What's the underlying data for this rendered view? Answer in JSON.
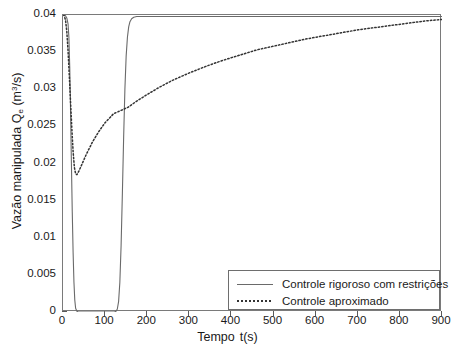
{
  "chart_data": {
    "type": "line",
    "title": "",
    "xlabel_prefix": "Tempo",
    "xlabel_suffix": "t(s)",
    "ylabel_text": "Vazão manipulada Q",
    "ylabel_sub": "e",
    "ylabel_unit_pre": " (m",
    "ylabel_unit_sup": "3",
    "ylabel_unit_post": "/s)",
    "xlim": [
      0,
      900
    ],
    "ylim": [
      0,
      0.04
    ],
    "xticks": [
      0,
      100,
      200,
      300,
      400,
      500,
      600,
      700,
      800,
      900
    ],
    "xtick_labels": [
      "0",
      "100",
      "200",
      "300",
      "400",
      "500",
      "600",
      "700",
      "800",
      "900"
    ],
    "yticks": [
      0,
      0.005,
      0.01,
      0.015,
      0.02,
      0.025,
      0.03,
      0.035,
      0.04
    ],
    "ytick_labels": [
      "0",
      "0.005",
      "0.01",
      "0.015",
      "0.02",
      "0.025",
      "0.03",
      "0.035",
      "0.04"
    ],
    "grid": false,
    "legend_position": "lower right",
    "series": [
      {
        "name": "Controle rigoroso com restrições",
        "style": "solid",
        "color": "#6a6a6a",
        "points": [
          [
            0,
            0.04
          ],
          [
            3,
            0.04
          ],
          [
            6,
            0.0399
          ],
          [
            9,
            0.0396
          ],
          [
            12,
            0.0388
          ],
          [
            14,
            0.037
          ],
          [
            16,
            0.033
          ],
          [
            18,
            0.027
          ],
          [
            20,
            0.02
          ],
          [
            22,
            0.0135
          ],
          [
            24,
            0.008
          ],
          [
            26,
            0.004
          ],
          [
            28,
            0.0016
          ],
          [
            30,
            0.0005
          ],
          [
            33,
            0.0001
          ],
          [
            36,
            0.0
          ],
          [
            45,
            0.0
          ],
          [
            60,
            0.0
          ],
          [
            80,
            0.0
          ],
          [
            100,
            0.0
          ],
          [
            115,
            0.0
          ],
          [
            122,
            0.0
          ],
          [
            126,
            0.0001
          ],
          [
            129,
            0.0004
          ],
          [
            132,
            0.0014
          ],
          [
            135,
            0.004
          ],
          [
            138,
            0.009
          ],
          [
            141,
            0.016
          ],
          [
            144,
            0.0235
          ],
          [
            147,
            0.03
          ],
          [
            150,
            0.0345
          ],
          [
            153,
            0.037
          ],
          [
            156,
            0.0384
          ],
          [
            159,
            0.0391
          ],
          [
            163,
            0.0395
          ],
          [
            168,
            0.0397
          ],
          [
            175,
            0.0398
          ],
          [
            190,
            0.0398
          ],
          [
            220,
            0.0398
          ],
          [
            300,
            0.0398
          ],
          [
            400,
            0.0398
          ],
          [
            500,
            0.0398
          ],
          [
            600,
            0.0398
          ],
          [
            700,
            0.0398
          ],
          [
            800,
            0.0398
          ],
          [
            900,
            0.0398
          ]
        ]
      },
      {
        "name": "Controle aproximado",
        "style": "dotted",
        "color": "#333333",
        "points": [
          [
            0,
            0.04
          ],
          [
            3,
            0.0399
          ],
          [
            6,
            0.0393
          ],
          [
            9,
            0.0378
          ],
          [
            12,
            0.0352
          ],
          [
            15,
            0.0318
          ],
          [
            18,
            0.0282
          ],
          [
            21,
            0.0247
          ],
          [
            24,
            0.0216
          ],
          [
            27,
            0.0195
          ],
          [
            30,
            0.0186
          ],
          [
            33,
            0.0185
          ],
          [
            38,
            0.019
          ],
          [
            45,
            0.0199
          ],
          [
            55,
            0.0212
          ],
          [
            70,
            0.0229
          ],
          [
            85,
            0.0243
          ],
          [
            100,
            0.0255
          ],
          [
            120,
            0.0267
          ],
          [
            140,
            0.0272
          ],
          [
            155,
            0.0276
          ],
          [
            175,
            0.0284
          ],
          [
            200,
            0.0293
          ],
          [
            230,
            0.0303
          ],
          [
            260,
            0.0312
          ],
          [
            300,
            0.0322
          ],
          [
            340,
            0.0331
          ],
          [
            380,
            0.0339
          ],
          [
            420,
            0.0346
          ],
          [
            460,
            0.0353
          ],
          [
            500,
            0.0358
          ],
          [
            540,
            0.0363
          ],
          [
            580,
            0.0368
          ],
          [
            620,
            0.0372
          ],
          [
            660,
            0.0376
          ],
          [
            700,
            0.038
          ],
          [
            740,
            0.0383
          ],
          [
            780,
            0.0386
          ],
          [
            820,
            0.0389
          ],
          [
            860,
            0.0392
          ],
          [
            900,
            0.0394
          ]
        ]
      }
    ]
  },
  "legend": {
    "entries": [
      {
        "label": "Controle rigoroso com restrições",
        "style": "solid"
      },
      {
        "label": "Controle aproximado",
        "style": "dotted"
      }
    ]
  }
}
